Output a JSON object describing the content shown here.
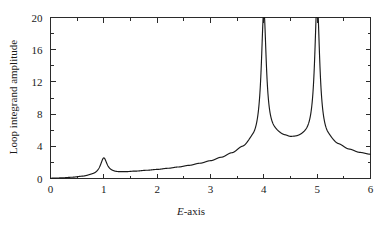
{
  "chart_data": {
    "type": "line",
    "title": "",
    "subtitle": "",
    "xlabel": "E-axis",
    "ylabel": "Loop integrand amplitude",
    "xlim": [
      0,
      6
    ],
    "ylim": [
      0,
      20
    ],
    "grid": false,
    "legend": null,
    "legend_position": "none",
    "x_ticks": [
      0,
      1,
      2,
      3,
      4,
      5,
      6
    ],
    "x_tick_labels": [
      "0",
      "1",
      "2",
      "3",
      "4",
      "5",
      "6"
    ],
    "x_minor_ticks": [
      0.5,
      1.5,
      2.5,
      3.5,
      4.5,
      5.5
    ],
    "y_ticks": [
      0,
      4,
      8,
      12,
      16,
      20
    ],
    "y_tick_labels": [
      "0",
      "4",
      "8",
      "12",
      "16",
      "20"
    ],
    "y_minor_ticks": [
      2,
      6,
      10,
      14,
      18
    ],
    "annotations": [],
    "series": [
      {
        "name": "Loop integrand amplitude",
        "color": "#1a1a1a",
        "resonances": [
          {
            "center": 1.0,
            "height": 2.0,
            "width": 0.075
          },
          {
            "center": 4.0,
            "height": 15.6,
            "width": 0.055
          },
          {
            "center": 5.0,
            "height": 16.8,
            "width": 0.055
          }
        ],
        "baseline_points": [
          [
            0.0,
            0.02
          ],
          [
            0.2,
            0.05
          ],
          [
            0.4,
            0.12
          ],
          [
            0.6,
            0.22
          ],
          [
            0.8,
            0.38
          ],
          [
            1.0,
            0.55
          ],
          [
            1.2,
            0.68
          ],
          [
            1.4,
            0.78
          ],
          [
            1.6,
            0.88
          ],
          [
            1.8,
            0.99
          ],
          [
            2.0,
            1.1
          ],
          [
            2.2,
            1.24
          ],
          [
            2.4,
            1.4
          ],
          [
            2.6,
            1.6
          ],
          [
            2.8,
            1.85
          ],
          [
            3.0,
            2.15
          ],
          [
            3.2,
            2.55
          ],
          [
            3.4,
            3.05
          ],
          [
            3.6,
            3.7
          ],
          [
            3.8,
            4.5
          ],
          [
            4.0,
            5.2
          ],
          [
            4.2,
            5.3
          ],
          [
            4.4,
            5.0
          ],
          [
            4.5,
            4.85
          ],
          [
            4.6,
            4.85
          ],
          [
            4.8,
            5.0
          ],
          [
            5.0,
            5.2
          ],
          [
            5.2,
            4.6
          ],
          [
            5.4,
            4.0
          ],
          [
            5.6,
            3.5
          ],
          [
            5.8,
            3.15
          ],
          [
            6.0,
            2.95
          ]
        ]
      }
    ]
  }
}
